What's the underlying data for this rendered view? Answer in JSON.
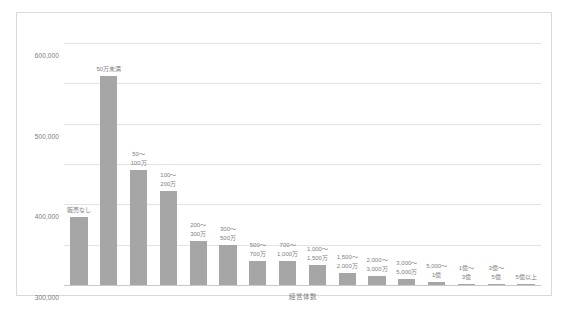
{
  "chart_data": {
    "type": "bar",
    "title": "",
    "xlabel": "経営体数",
    "ylabel": "",
    "ylim": [
      0,
      600000
    ],
    "ytick_labels": [
      "600,000",
      "500,000",
      "400,000",
      "300,000",
      "200,000",
      "100,000",
      "0"
    ],
    "ytick_values": [
      600000,
      500000,
      400000,
      300000,
      200000,
      100000,
      0
    ],
    "grid": true,
    "legend": "none",
    "bar_color": "#a6a6a6",
    "categories": [
      "販売なし",
      "50万未満",
      "50〜100万",
      "100〜200万",
      "200〜300万",
      "300〜500万",
      "500〜700万",
      "700〜1,000万",
      "1,000〜1,500万",
      "1,500〜2,000万",
      "2,000〜3,000万",
      "3,000〜5,000万",
      "5,000〜1億",
      "1億〜3億",
      "3億〜5億",
      "5億以上"
    ],
    "category_lines": [
      [
        "販売なし",
        ""
      ],
      [
        "50万未満",
        ""
      ],
      [
        "50〜",
        "100万"
      ],
      [
        "100〜",
        "200万"
      ],
      [
        "200〜",
        "300万"
      ],
      [
        "300〜",
        "500万"
      ],
      [
        "500〜",
        "700万"
      ],
      [
        "700〜",
        "1,000万"
      ],
      [
        "1,000〜",
        "1,500万"
      ],
      [
        "1,500〜",
        "2,000万"
      ],
      [
        "2,000〜",
        "3,000万"
      ],
      [
        "3,000〜",
        "5,000万"
      ],
      [
        "5,000〜",
        "1億"
      ],
      [
        "1億〜",
        "3億"
      ],
      [
        "3億〜",
        "5億"
      ],
      [
        "5億以上",
        ""
      ]
    ],
    "values": [
      168000,
      518000,
      285000,
      232000,
      110000,
      100000,
      60000,
      60000,
      50000,
      30000,
      22000,
      14000,
      7000,
      3000,
      1500,
      1200
    ]
  }
}
